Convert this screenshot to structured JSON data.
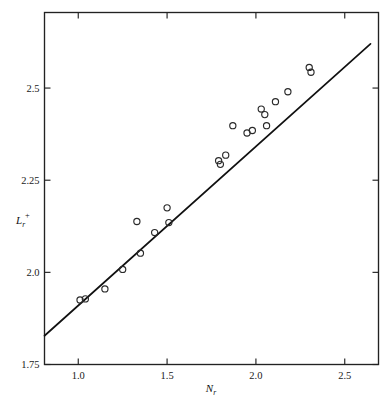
{
  "chart_data": {
    "type": "scatter",
    "title": "",
    "subtitle": "",
    "xlabel": "N_r",
    "xlabel_base": "N",
    "xlabel_sub": "r",
    "ylabel": "L_r^+",
    "ylabel_base": "L",
    "ylabel_sub": "r",
    "ylabel_sup": "+",
    "xlim": [
      0.81,
      2.69
    ],
    "ylim": [
      1.75,
      2.705
    ],
    "xticks": [
      1.0,
      1.5,
      2.0,
      2.5
    ],
    "xtick_labels": [
      "1.0",
      "1.5",
      "2.0",
      "2.5"
    ],
    "yticks": [
      1.75,
      2.0,
      2.25,
      2.5
    ],
    "ytick_labels": [
      "1.75",
      "2.0",
      "2.25",
      "2.5"
    ],
    "grid": false,
    "legend": null,
    "legend_position": "none",
    "marker": "open-circle",
    "marker_color": "#2a2a2a",
    "line_color": "#111111",
    "frame_color": "#222222",
    "background": "#ffffff",
    "points": [
      {
        "x": 1.01,
        "y": 1.925
      },
      {
        "x": 1.04,
        "y": 1.928
      },
      {
        "x": 1.15,
        "y": 1.955
      },
      {
        "x": 1.25,
        "y": 2.008
      },
      {
        "x": 1.33,
        "y": 2.138
      },
      {
        "x": 1.35,
        "y": 2.052
      },
      {
        "x": 1.43,
        "y": 2.108
      },
      {
        "x": 1.5,
        "y": 2.175
      },
      {
        "x": 1.51,
        "y": 2.135
      },
      {
        "x": 1.79,
        "y": 2.303
      },
      {
        "x": 1.8,
        "y": 2.293
      },
      {
        "x": 1.83,
        "y": 2.318
      },
      {
        "x": 1.87,
        "y": 2.398
      },
      {
        "x": 1.95,
        "y": 2.378
      },
      {
        "x": 1.98,
        "y": 2.385
      },
      {
        "x": 2.03,
        "y": 2.443
      },
      {
        "x": 2.05,
        "y": 2.428
      },
      {
        "x": 2.06,
        "y": 2.398
      },
      {
        "x": 2.11,
        "y": 2.463
      },
      {
        "x": 2.18,
        "y": 2.49
      },
      {
        "x": 2.3,
        "y": 2.556
      },
      {
        "x": 2.31,
        "y": 2.543
      }
    ],
    "fit_line": {
      "label": "linear fit",
      "x": [
        0.81,
        2.645
      ],
      "y": [
        1.828,
        2.62
      ],
      "slope": 0.432,
      "intercept": 1.478
    }
  }
}
